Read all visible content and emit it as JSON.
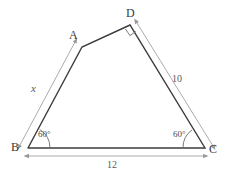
{
  "figure": {
    "type": "geometry-diagram",
    "colors": {
      "background": "#ffffff",
      "outline": "#3c3c3c",
      "dimension": "#9a9a9a",
      "angle_arc": "#6a6a6a",
      "label_text": "#3a3a3a",
      "dimension_text": "#5a5a5a"
    },
    "vertices": [
      {
        "name": "B",
        "label": "B",
        "x": 28,
        "y": 148
      },
      {
        "name": "A",
        "label": "A",
        "x": 82,
        "y": 47
      },
      {
        "name": "D",
        "label": "D",
        "x": 130,
        "y": 25
      },
      {
        "name": "C",
        "label": "C",
        "x": 205,
        "y": 148
      }
    ],
    "sides": [
      {
        "name": "BA",
        "from": "B",
        "to": "A"
      },
      {
        "name": "AD",
        "from": "A",
        "to": "D"
      },
      {
        "name": "DC",
        "from": "D",
        "to": "C"
      },
      {
        "name": "BC",
        "from": "B",
        "to": "C"
      }
    ],
    "dimensions": [
      {
        "name": "side-BA",
        "label": "x",
        "italic": true,
        "along": "B-A"
      },
      {
        "name": "side-DC",
        "label": "10",
        "italic": false,
        "along": "D-C"
      },
      {
        "name": "side-BC",
        "label": "12",
        "italic": false,
        "along": "B-C"
      }
    ],
    "angles": [
      {
        "name": "angle-B",
        "label": "60°",
        "at": "B",
        "value": 60
      },
      {
        "name": "angle-C",
        "label": "60°",
        "at": "C",
        "value": 60
      },
      {
        "name": "angle-D",
        "label": "",
        "at": "D",
        "marker": "right-angle-square"
      }
    ]
  }
}
